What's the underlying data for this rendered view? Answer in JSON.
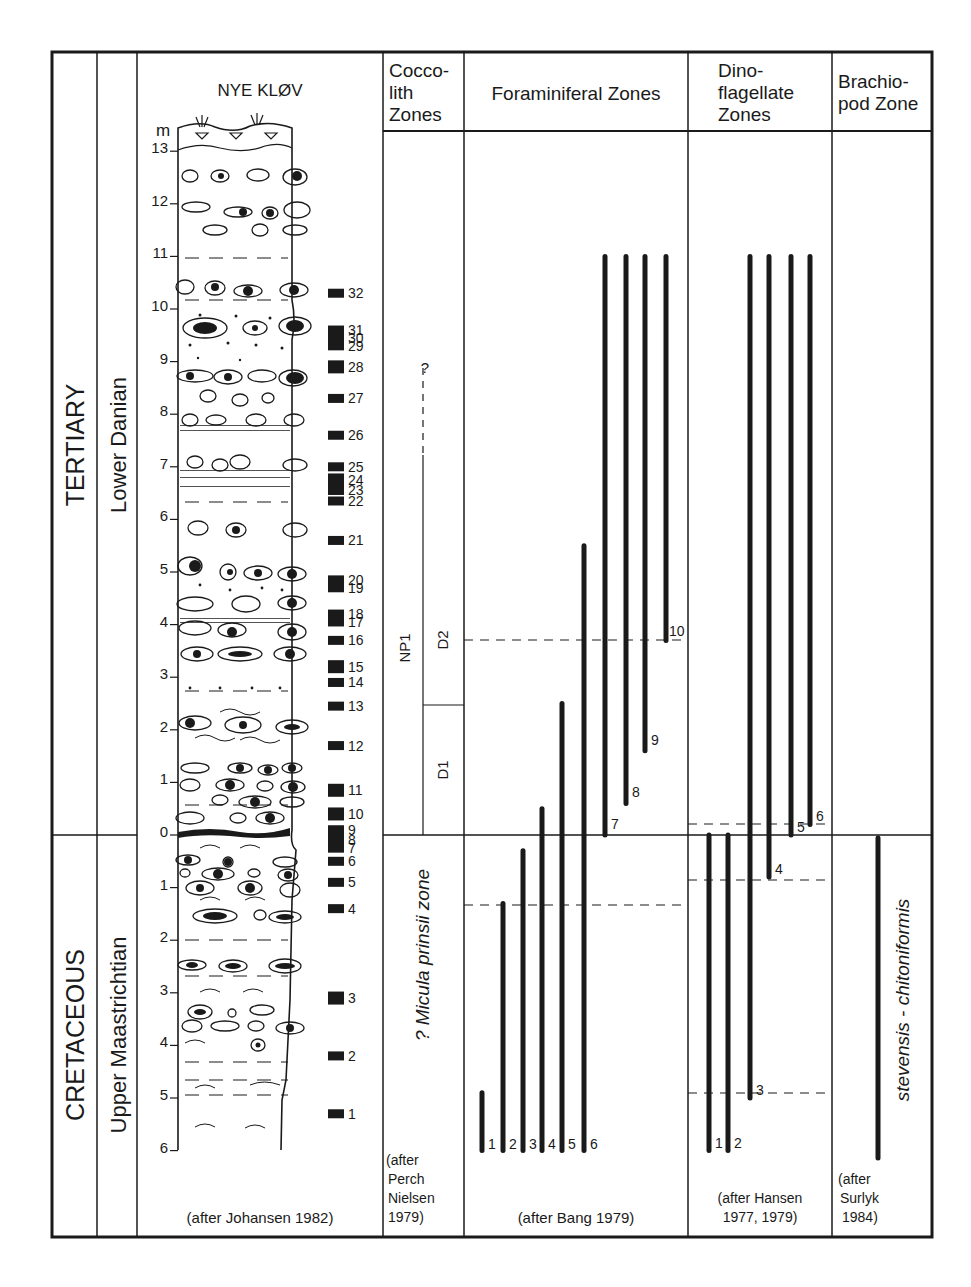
{
  "chart_data": {
    "type": "range-chart",
    "title": "NYE KLØV",
    "unit_label": "m",
    "columns": [
      "System",
      "Stage",
      "Section",
      "Coccolith Zones",
      "Foraminiferal Zones",
      "Dinoflagellate Zones",
      "Brachiopod Zone"
    ],
    "headers": {
      "coccolith": [
        "Cocco-",
        "lith",
        "Zones"
      ],
      "foraminiferal": [
        "Foraminiferal Zones"
      ],
      "dinoflagellate": [
        "Dino-",
        "flagellate",
        "Zones"
      ],
      "brachiopod": [
        "Brachio-",
        "pod Zone"
      ]
    },
    "systems": {
      "upper": "TERTIARY",
      "lower": "CRETACEOUS"
    },
    "stages": {
      "upper": "Lower Danian",
      "lower": "Upper Maastrichtian"
    },
    "depth_ticks_upper": [
      "13",
      "12",
      "11",
      "10",
      "9",
      "8",
      "7",
      "6",
      "5",
      "4",
      "3",
      "2",
      "1",
      "0"
    ],
    "depth_ticks_lower": [
      "1",
      "2",
      "3",
      "4",
      "5",
      "6"
    ],
    "samples": [
      {
        "n": "1",
        "m": -5.3
      },
      {
        "n": "2",
        "m": -4.2
      },
      {
        "n": "3",
        "m": -3.1
      },
      {
        "n": "4",
        "m": -1.4
      },
      {
        "n": "5",
        "m": -0.9
      },
      {
        "n": "6",
        "m": -0.5
      },
      {
        "n": "7",
        "m": -0.25
      },
      {
        "n": "8",
        "m": -0.1
      },
      {
        "n": "9",
        "m": 0.1
      },
      {
        "n": "10",
        "m": 0.4
      },
      {
        "n": "11",
        "m": 0.85
      },
      {
        "n": "12",
        "m": 1.7
      },
      {
        "n": "13",
        "m": 2.45
      },
      {
        "n": "14",
        "m": 2.9
      },
      {
        "n": "15",
        "m": 3.2
      },
      {
        "n": "16",
        "m": 3.7
      },
      {
        "n": "17",
        "m": 4.05
      },
      {
        "n": "18",
        "m": 4.2
      },
      {
        "n": "19",
        "m": 4.7
      },
      {
        "n": "20",
        "m": 4.85
      },
      {
        "n": "21",
        "m": 5.6
      },
      {
        "n": "22",
        "m": 6.35
      },
      {
        "n": "23",
        "m": 6.55
      },
      {
        "n": "24",
        "m": 6.75
      },
      {
        "n": "25",
        "m": 7.0
      },
      {
        "n": "26",
        "m": 7.6
      },
      {
        "n": "27",
        "m": 8.3
      },
      {
        "n": "28",
        "m": 8.9
      },
      {
        "n": "29",
        "m": 9.3
      },
      {
        "n": "30",
        "m": 9.45
      },
      {
        "n": "31",
        "m": 9.6
      },
      {
        "n": "32",
        "m": 10.3
      }
    ],
    "coccolith_zones": {
      "main": "NP1",
      "subzones": [
        "D2",
        "D1"
      ],
      "query": "?",
      "cretaceous": "? Micula prinsii zone",
      "source": [
        "(after",
        "Perch",
        "Nielsen",
        "1979)"
      ]
    },
    "foraminiferal_ranges": [
      {
        "n": "1",
        "from": -6.0,
        "to": -4.9
      },
      {
        "n": "2",
        "from": -6.0,
        "to": -1.3
      },
      {
        "n": "3",
        "from": -6.0,
        "to": -0.3
      },
      {
        "n": "4",
        "from": -6.0,
        "to": 0.5
      },
      {
        "n": "5",
        "from": -6.0,
        "to": 2.5
      },
      {
        "n": "6",
        "from": -6.0,
        "to": 5.5
      },
      {
        "n": "7",
        "from": 0.0,
        "to": 11.0
      },
      {
        "n": "8",
        "from": 0.6,
        "to": 11.0
      },
      {
        "n": "9",
        "from": 1.6,
        "to": 11.0
      },
      {
        "n": "10",
        "from": 3.7,
        "to": 11.0
      }
    ],
    "foraminiferal_source": "(after Bang 1979)",
    "dinoflagellate_ranges": [
      {
        "n": "1",
        "from": -6.0,
        "to": 0.0
      },
      {
        "n": "2",
        "from": -6.0,
        "to": 0.0
      },
      {
        "n": "3",
        "from": -5.0,
        "to": 11.0
      },
      {
        "n": "4",
        "from": -0.8,
        "to": 11.0
      },
      {
        "n": "5",
        "from": 0.0,
        "to": 11.0
      },
      {
        "n": "6",
        "from": 0.2,
        "to": 11.0
      }
    ],
    "dinoflagellate_source": [
      "(after Hansen",
      "1977, 1979)"
    ],
    "brachiopod_zone": {
      "name": "stevensis - chitoniformis",
      "from": -6.0,
      "to": 0.0,
      "source": [
        "(after",
        "Surlyk",
        "1984)"
      ]
    },
    "section_source": "(after Johansen 1982)"
  }
}
